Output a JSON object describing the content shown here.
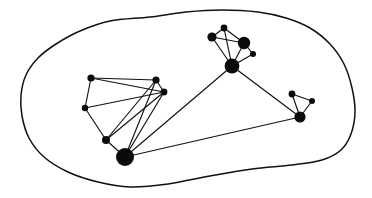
{
  "figure": {
    "width": 372,
    "height": 198,
    "background_color": "#ffffff",
    "ink_color": "#111111",
    "node_fill_color": "#0b0b0b"
  },
  "boundary": {
    "name": "hand-drawn-enclosing-curve",
    "stroke_color": "#111111",
    "stroke_width": 1.5,
    "closed": true,
    "points": [
      [
        150,
        17
      ],
      [
        110,
        21
      ],
      [
        80,
        31
      ],
      [
        56,
        44
      ],
      [
        38,
        58
      ],
      [
        26,
        75
      ],
      [
        21,
        95
      ],
      [
        22,
        116
      ],
      [
        29,
        138
      ],
      [
        44,
        157
      ],
      [
        68,
        172
      ],
      [
        98,
        182
      ],
      [
        130,
        187
      ],
      [
        168,
        184
      ],
      [
        210,
        176
      ],
      [
        252,
        169
      ],
      [
        292,
        165
      ],
      [
        322,
        160
      ],
      [
        341,
        150
      ],
      [
        351,
        134
      ],
      [
        355,
        112
      ],
      [
        352,
        88
      ],
      [
        344,
        64
      ],
      [
        330,
        44
      ],
      [
        310,
        28
      ],
      [
        286,
        18
      ],
      [
        258,
        12
      ],
      [
        222,
        10
      ],
      [
        186,
        12
      ],
      [
        150,
        17
      ]
    ]
  },
  "chart_data": {
    "type": "graph",
    "node_count": 13,
    "edge_count": 22,
    "nodes": [
      {
        "id": "n1",
        "label": "left-top-left",
        "x": 91,
        "y": 78,
        "r": 3.6,
        "size": "small",
        "cluster": "left"
      },
      {
        "id": "n2",
        "label": "left-mid-left",
        "x": 85,
        "y": 108,
        "r": 3.2,
        "size": "small",
        "cluster": "left"
      },
      {
        "id": "n3",
        "label": "left-top-right",
        "x": 156,
        "y": 80,
        "r": 3.6,
        "size": "small",
        "cluster": "left"
      },
      {
        "id": "n4",
        "label": "left-right",
        "x": 164,
        "y": 92,
        "r": 3.4,
        "size": "small",
        "cluster": "left"
      },
      {
        "id": "n5",
        "label": "left-lower-mid",
        "x": 106,
        "y": 140,
        "r": 4.0,
        "size": "medium",
        "cluster": "left"
      },
      {
        "id": "n6",
        "label": "left-hub",
        "x": 125,
        "y": 157,
        "r": 9.0,
        "size": "large",
        "cluster": "left"
      },
      {
        "id": "n7",
        "label": "top-left-small",
        "x": 212,
        "y": 37,
        "r": 4.6,
        "size": "medium",
        "cluster": "top"
      },
      {
        "id": "n8",
        "label": "top-apex",
        "x": 224,
        "y": 28,
        "r": 3.4,
        "size": "small",
        "cluster": "top"
      },
      {
        "id": "n9",
        "label": "top-right-large",
        "x": 244,
        "y": 43,
        "r": 6.2,
        "size": "large",
        "cluster": "top"
      },
      {
        "id": "n10",
        "label": "top-right-tiny",
        "x": 253,
        "y": 54,
        "r": 3.0,
        "size": "small",
        "cluster": "top"
      },
      {
        "id": "n11",
        "label": "top-hub",
        "x": 232,
        "y": 66,
        "r": 7.4,
        "size": "large",
        "cluster": "top"
      },
      {
        "id": "n12",
        "label": "right-top-small",
        "x": 292,
        "y": 94,
        "r": 3.4,
        "size": "small",
        "cluster": "right"
      },
      {
        "id": "n13",
        "label": "right-tiny",
        "x": 312,
        "y": 101,
        "r": 3.0,
        "size": "small",
        "cluster": "right"
      },
      {
        "id": "n14",
        "label": "right-hub",
        "x": 300,
        "y": 117,
        "r": 5.6,
        "size": "large",
        "cluster": "right"
      }
    ],
    "edges": [
      {
        "source": "n1",
        "target": "n3"
      },
      {
        "source": "n1",
        "target": "n2"
      },
      {
        "source": "n1",
        "target": "n4"
      },
      {
        "source": "n2",
        "target": "n4"
      },
      {
        "source": "n2",
        "target": "n5"
      },
      {
        "source": "n3",
        "target": "n4"
      },
      {
        "source": "n3",
        "target": "n5"
      },
      {
        "source": "n3",
        "target": "n6"
      },
      {
        "source": "n4",
        "target": "n6"
      },
      {
        "source": "n4",
        "target": "n5"
      },
      {
        "source": "n5",
        "target": "n6"
      },
      {
        "source": "n3",
        "target": "n6b"
      },
      {
        "source": "n7",
        "target": "n8"
      },
      {
        "source": "n7",
        "target": "n9"
      },
      {
        "source": "n7",
        "target": "n11"
      },
      {
        "source": "n8",
        "target": "n9"
      },
      {
        "source": "n8",
        "target": "n11"
      },
      {
        "source": "n9",
        "target": "n10"
      },
      {
        "source": "n9",
        "target": "n11"
      },
      {
        "source": "n10",
        "target": "n11"
      },
      {
        "source": "n12",
        "target": "n13"
      },
      {
        "source": "n12",
        "target": "n14"
      },
      {
        "source": "n13",
        "target": "n14"
      },
      {
        "source": "n6",
        "target": "n11"
      },
      {
        "source": "n6",
        "target": "n14"
      },
      {
        "source": "n11",
        "target": "n14"
      }
    ],
    "clusters": [
      {
        "id": "left",
        "label": "left cluster",
        "member_count": 6
      },
      {
        "id": "top",
        "label": "top-right cluster",
        "member_count": 5
      },
      {
        "id": "right",
        "label": "right cluster",
        "member_count": 3
      }
    ],
    "grid": false,
    "legend": null,
    "xlabel": "",
    "ylabel": ""
  }
}
